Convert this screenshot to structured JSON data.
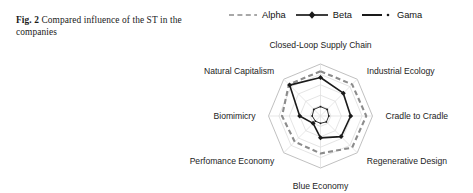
{
  "caption": {
    "fig_label": "Fig. 2",
    "text": "Compared influence of the ST in the companies"
  },
  "legend": {
    "items": [
      {
        "label": "Alpha",
        "style": "dashed",
        "color": "#8c8c8c",
        "marker": "none"
      },
      {
        "label": "Beta",
        "style": "solid",
        "color": "#1a1a1a",
        "marker": "diamond"
      },
      {
        "label": "Gama",
        "style": "solid",
        "color": "#1a1a1a",
        "marker": "dot"
      }
    ]
  },
  "chart_data": {
    "type": "radar",
    "title": "",
    "categories": [
      "Closed-Loop Supply Chain",
      "Industrial Ecology",
      "Cradle to Cradle",
      "Regenerative Design",
      "Blue Economy",
      "Perfomance Economy",
      "Biomimicry",
      "Natural Capitalism"
    ],
    "rings": 5,
    "grid": true,
    "rlim": [
      0,
      1
    ],
    "legend_position": "top",
    "series": [
      {
        "name": "Alpha",
        "color": "#8c8c8c",
        "style": "dashed",
        "marker": "none",
        "values": [
          0.86,
          0.86,
          0.88,
          0.86,
          0.72,
          0.7,
          0.74,
          0.86
        ]
      },
      {
        "name": "Beta",
        "color": "#1a1a1a",
        "style": "solid",
        "marker": "diamond",
        "values": [
          0.74,
          0.62,
          0.58,
          0.56,
          0.42,
          0.2,
          0.4,
          0.84
        ]
      },
      {
        "name": "Gama",
        "color": "#1a1a1a",
        "style": "solid",
        "marker": "dot",
        "values": [
          0.18,
          0.18,
          0.16,
          0.16,
          0.14,
          0.14,
          0.16,
          0.18
        ]
      }
    ]
  }
}
